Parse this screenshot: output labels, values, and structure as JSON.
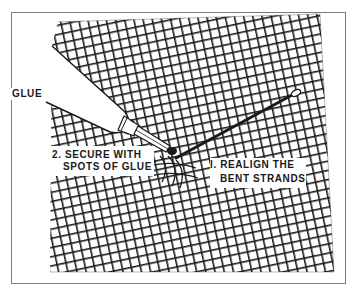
{
  "figure": {
    "border_color": "#7a7a7a",
    "ink_color": "#1a1a1a",
    "background": "#ffffff",
    "labels": {
      "glue": "GLUE",
      "step2_line1": "2. SECURE WITH",
      "step2_line2": "SPOTS OF GLUE",
      "step1_line1": "I. REALIGN THE",
      "step1_line2": "BENT STRANDS"
    },
    "elements": [
      {
        "name": "screen-mesh",
        "kind": "woven wire grid"
      },
      {
        "name": "glue-tube",
        "kind": "tube with nozzle"
      },
      {
        "name": "needle",
        "kind": "awl/needle with eye"
      }
    ]
  }
}
